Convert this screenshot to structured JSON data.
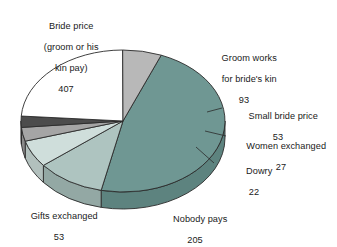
{
  "chart_data": {
    "type": "pie",
    "title": "",
    "subtitle": "",
    "xlabel": "",
    "ylabel": "",
    "legend_position": "none",
    "grid": false,
    "labels_outside": true,
    "total": 860,
    "categories": [
      "Bride price (groom or his kin pay)",
      "Groom works for bride's kin",
      "Small bride price",
      "Women exchanged",
      "Dowry",
      "Nobody pays",
      "Gifts exchanged"
    ],
    "values": [
      407,
      93,
      53,
      27,
      22,
      205,
      53
    ],
    "slices": [
      {
        "name": "bride-price",
        "label_line1": "Bride price",
        "label_line2": "(groom or his",
        "label_line3": "kin pay)",
        "value": "407",
        "color": "#6f9793",
        "side_color": "#5d837f"
      },
      {
        "name": "groom-works",
        "label_line1": "Groom works",
        "label_line2": "for bride's kin",
        "label_line3": "",
        "value": "93",
        "color": "#aec4c0",
        "side_color": "#93a8a4"
      },
      {
        "name": "small-bride-price",
        "label_line1": "Small bride price",
        "label_line2": "",
        "label_line3": "",
        "value": "53",
        "color": "#cfdedb",
        "side_color": "#b2c0bd"
      },
      {
        "name": "women-exchanged",
        "label_line1": "Women exchanged",
        "label_line2": "",
        "label_line3": "",
        "value": "27",
        "color": "#a5a5a5",
        "side_color": "#8a8a8a"
      },
      {
        "name": "dowry",
        "label_line1": "Dowry",
        "label_line2": "",
        "label_line3": "",
        "value": "22",
        "color": "#4c4c4c",
        "side_color": "#3a3a3a"
      },
      {
        "name": "nobody-pays",
        "label_line1": "Nobody pays",
        "label_line2": "",
        "label_line3": "",
        "value": "205",
        "color": "#ffffff",
        "side_color": "#ededed"
      },
      {
        "name": "gifts-exchanged",
        "label_line1": "Gifts exchanged",
        "label_line2": "",
        "label_line3": "",
        "value": "53",
        "color": "#b8b8b8",
        "side_color": "#9c9c9c"
      }
    ]
  },
  "labels": {
    "bride_price": {
      "line1": "Bride price",
      "line2": "(groom or his",
      "line3": "kin pay)",
      "value": "407"
    },
    "groom_works": {
      "line1": "Groom works",
      "line2": "for bride's kin",
      "value": "93"
    },
    "small_bride": {
      "line1": "Small bride price",
      "value": "53"
    },
    "women_exch": {
      "line1": "Women exchanged",
      "value": "27"
    },
    "dowry": {
      "line1": "Dowry",
      "value": "22"
    },
    "gifts_exch": {
      "line1": "Gifts exchanged",
      "value": "53"
    },
    "nobody_pays": {
      "line1": "Nobody pays",
      "value": "205"
    }
  },
  "colors": {
    "bride_price": "#6f9793",
    "groom_works": "#aec4c0",
    "small_bride": "#cfdedb",
    "women_exch": "#a5a5a5",
    "dowry": "#4c4c4c",
    "nobody_pays": "#ffffff",
    "gifts_exch": "#b8b8b8",
    "outline": "#2b2b2b",
    "background": "#ffffff"
  }
}
